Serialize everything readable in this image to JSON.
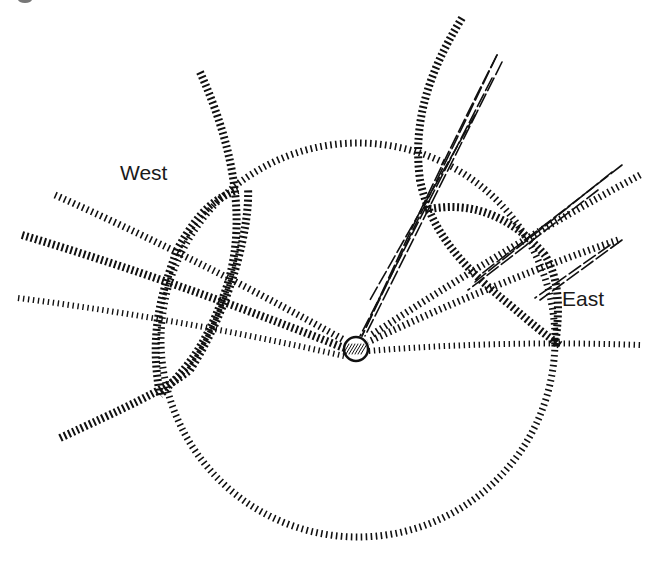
{
  "diagram": {
    "type": "celestial-sphere-sketch",
    "width": 661,
    "height": 565,
    "background": "#ffffff",
    "ink_color": "#111111",
    "labels": {
      "west": {
        "text": "West",
        "x": 120,
        "y": 162
      },
      "east": {
        "text": "East",
        "x": 562,
        "y": 288
      }
    },
    "sphere": {
      "shape": "circle",
      "cx": 358,
      "cy": 340,
      "r": 197,
      "style": "hatched"
    },
    "observer_hub": {
      "cx": 356,
      "cy": 349,
      "r": 12,
      "style": "hatched-filled"
    },
    "west_arcs": [
      {
        "name": "west-meridian-arc",
        "path": "M 200 72 C 235 150, 250 230, 222 300 C 205 345, 190 365, 160 395"
      },
      {
        "name": "west-crossing-arc",
        "path": "M 60 438 C 120 410, 165 390, 190 370 C 235 300, 250 220, 248 188"
      },
      {
        "name": "west-inner-arc",
        "path": "M 160 395 C 150 340, 158 300, 178 248 C 200 210, 215 198, 238 190"
      }
    ],
    "east_arcs": [
      {
        "name": "east-meridian-arc",
        "path": "M 462 18 C 430 70, 412 120, 420 180 C 430 230, 460 265, 510 305 C 530 322, 545 335, 560 345"
      },
      {
        "name": "east-rising-arc",
        "path": "M 425 210 C 470 200, 510 215, 545 255 C 560 280, 560 310, 555 345"
      }
    ],
    "rays_to_hub": [
      {
        "name": "ray-west-upper",
        "x1": 55,
        "y1": 195,
        "x2": 344,
        "y2": 340,
        "style": "hatch-sparse"
      },
      {
        "name": "ray-west-middle",
        "x1": 22,
        "y1": 235,
        "x2": 344,
        "y2": 348,
        "style": "hatch-dense"
      },
      {
        "name": "ray-west-lower",
        "x1": 18,
        "y1": 298,
        "x2": 344,
        "y2": 356,
        "style": "hatch-fine"
      },
      {
        "name": "ray-east-horizon",
        "x1": 640,
        "y1": 345,
        "x2": 368,
        "y2": 351,
        "style": "hatch-fine"
      },
      {
        "name": "ray-east-rising",
        "x1": 618,
        "y1": 240,
        "x2": 368,
        "y2": 342,
        "style": "hatch-sparse"
      },
      {
        "name": "ray-east-high",
        "x1": 640,
        "y1": 175,
        "x2": 370,
        "y2": 336,
        "style": "hatch-sparse"
      },
      {
        "name": "ray-zenith-strand",
        "x1": 497,
        "y1": 55,
        "x2": 362,
        "y2": 336,
        "style": "solid-strand"
      }
    ],
    "zenith_bundle": [
      {
        "x1": 497,
        "y1": 55,
        "x2": 362,
        "y2": 336
      },
      {
        "x1": 502,
        "y1": 62,
        "x2": 365,
        "y2": 336
      },
      {
        "x1": 492,
        "y1": 78,
        "x2": 360,
        "y2": 336
      },
      {
        "x1": 475,
        "y1": 115,
        "x2": 370,
        "y2": 300
      }
    ],
    "east_bundle": [
      {
        "x1": 622,
        "y1": 165,
        "x2": 480,
        "y2": 275
      },
      {
        "x1": 612,
        "y1": 172,
        "x2": 475,
        "y2": 282
      },
      {
        "x1": 598,
        "y1": 190,
        "x2": 468,
        "y2": 290
      },
      {
        "x1": 622,
        "y1": 240,
        "x2": 540,
        "y2": 300
      },
      {
        "x1": 610,
        "y1": 245,
        "x2": 535,
        "y2": 298
      }
    ]
  }
}
